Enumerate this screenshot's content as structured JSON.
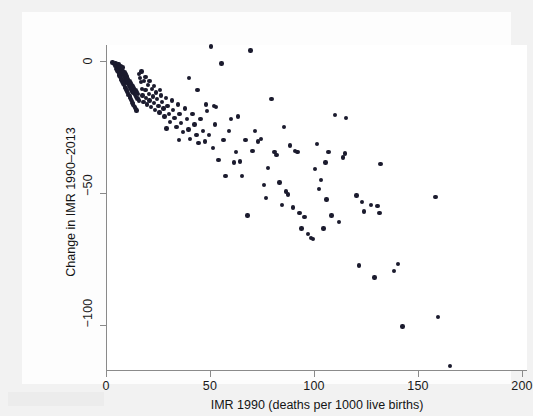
{
  "figure": {
    "background_color": "#f2f2f2",
    "plot_background_color": "#ffffff",
    "marker_color": "#1b1b2e",
    "grid_color": "#ececec",
    "axis_color": "#8a8a8a"
  },
  "chart_data": {
    "type": "scatter",
    "title": "",
    "xlabel": "IMR 1990 (deaths per 1000 live births)",
    "ylabel": "Change in IMR 1990–2013",
    "xlim": [
      0,
      200
    ],
    "ylim": [
      -120,
      8
    ],
    "xticks": [
      0,
      50,
      100,
      150,
      200
    ],
    "xtick_labels": [
      "0",
      "50",
      "100",
      "150",
      "200"
    ],
    "yticks": [
      0,
      -50,
      -100
    ],
    "ytick_labels": [
      "0",
      "−50",
      "−100"
    ],
    "grid": "horizontal",
    "legend": "none",
    "n_points": 193,
    "points": [
      [
        4.5,
        -1.0
      ],
      [
        5.2,
        -1.5
      ],
      [
        5.5,
        -2.3
      ],
      [
        6.0,
        -1.2
      ],
      [
        6.3,
        -2.8
      ],
      [
        6.6,
        -3.4
      ],
      [
        6.9,
        -2.0
      ],
      [
        7.1,
        -4.0
      ],
      [
        7.4,
        -3.1
      ],
      [
        7.6,
        -4.6
      ],
      [
        7.9,
        -2.5
      ],
      [
        8.1,
        -5.2
      ],
      [
        8.3,
        -3.8
      ],
      [
        8.6,
        -6.0
      ],
      [
        8.8,
        -4.4
      ],
      [
        9.0,
        -6.8
      ],
      [
        9.3,
        -5.0
      ],
      [
        9.5,
        -7.4
      ],
      [
        9.8,
        -5.8
      ],
      [
        10.0,
        -8.1
      ],
      [
        10.2,
        -6.4
      ],
      [
        10.5,
        -8.8
      ],
      [
        10.7,
        -7.0
      ],
      [
        11.0,
        -9.4
      ],
      [
        11.2,
        -7.7
      ],
      [
        11.5,
        -10.1
      ],
      [
        11.8,
        -8.4
      ],
      [
        12.0,
        -10.8
      ],
      [
        12.3,
        -9.0
      ],
      [
        12.6,
        -11.5
      ],
      [
        12.9,
        -9.7
      ],
      [
        13.2,
        -12.2
      ],
      [
        13.5,
        -10.4
      ],
      [
        13.8,
        -12.9
      ],
      [
        14.1,
        -11.1
      ],
      [
        14.5,
        -13.6
      ],
      [
        14.8,
        -11.8
      ],
      [
        15.2,
        -14.2
      ],
      [
        15.5,
        -12.5
      ],
      [
        15.9,
        -14.9
      ],
      [
        5.0,
        -3.0
      ],
      [
        5.8,
        -4.2
      ],
      [
        6.5,
        -5.5
      ],
      [
        7.2,
        -6.6
      ],
      [
        8.0,
        -7.8
      ],
      [
        8.7,
        -9.1
      ],
      [
        9.4,
        -10.3
      ],
      [
        10.1,
        -11.6
      ],
      [
        10.9,
        -12.8
      ],
      [
        11.6,
        -14.0
      ],
      [
        12.4,
        -15.2
      ],
      [
        13.1,
        -16.4
      ],
      [
        13.9,
        -17.6
      ],
      [
        14.6,
        -18.8
      ],
      [
        4.8,
        -2.0
      ],
      [
        5.4,
        -3.6
      ],
      [
        6.1,
        -4.8
      ],
      [
        6.8,
        -6.0
      ],
      [
        7.5,
        -7.2
      ],
      [
        8.4,
        -8.5
      ],
      [
        9.1,
        -9.8
      ],
      [
        9.9,
        -11.0
      ],
      [
        10.6,
        -12.2
      ],
      [
        11.4,
        -13.4
      ],
      [
        12.1,
        -14.6
      ],
      [
        12.8,
        -15.8
      ],
      [
        13.6,
        -17.0
      ],
      [
        14.3,
        -18.2
      ],
      [
        16.3,
        -6.5
      ],
      [
        16.8,
        -8.0
      ],
      [
        17.2,
        -10.5
      ],
      [
        17.6,
        -13.0
      ],
      [
        18.0,
        -15.5
      ],
      [
        18.4,
        -7.5
      ],
      [
        18.9,
        -11.0
      ],
      [
        19.3,
        -14.0
      ],
      [
        19.7,
        -16.5
      ],
      [
        20.2,
        -9.0
      ],
      [
        20.6,
        -12.5
      ],
      [
        21.0,
        -15.0
      ],
      [
        21.5,
        -17.5
      ],
      [
        22.0,
        -10.5
      ],
      [
        22.5,
        -13.5
      ],
      [
        23.0,
        -16.0
      ],
      [
        23.5,
        -18.5
      ],
      [
        24.0,
        -12.0
      ],
      [
        24.6,
        -14.5
      ],
      [
        25.2,
        -17.0
      ],
      [
        25.8,
        -19.5
      ],
      [
        26.4,
        -13.0
      ],
      [
        27.0,
        -15.5
      ],
      [
        27.6,
        -18.0
      ],
      [
        28.2,
        -21.0
      ],
      [
        28.9,
        -14.0
      ],
      [
        29.5,
        -17.0
      ],
      [
        30.2,
        -20.0
      ],
      [
        30.9,
        -23.0
      ],
      [
        31.6,
        -15.0
      ],
      [
        32.3,
        -18.5
      ],
      [
        33.0,
        -21.5
      ],
      [
        33.8,
        -25.0
      ],
      [
        34.5,
        -16.5
      ],
      [
        35.3,
        -20.0
      ],
      [
        36.1,
        -23.5
      ],
      [
        37.0,
        -27.0
      ],
      [
        38.0,
        -18.0
      ],
      [
        38.8,
        -22.0
      ],
      [
        39.6,
        -26.0
      ],
      [
        40.5,
        -29.5
      ],
      [
        41.5,
        -20.0
      ],
      [
        42.5,
        -24.0
      ],
      [
        43.5,
        -28.0
      ],
      [
        44.5,
        -31.0
      ],
      [
        45.5,
        -22.0
      ],
      [
        46.5,
        -26.5
      ],
      [
        47.5,
        -30.5
      ],
      [
        48.5,
        -19.0
      ],
      [
        49.5,
        -28.0
      ],
      [
        50.5,
        5.5
      ],
      [
        51.5,
        -33.0
      ],
      [
        52.5,
        -24.0
      ],
      [
        54.0,
        -37.5
      ],
      [
        55.5,
        -1.0
      ],
      [
        56.5,
        -30.0
      ],
      [
        57.5,
        -43.5
      ],
      [
        59.0,
        -26.5
      ],
      [
        60.0,
        -22.0
      ],
      [
        61.5,
        -38.5
      ],
      [
        62.5,
        -34.5
      ],
      [
        63.5,
        -21.0
      ],
      [
        64.5,
        -38.0
      ],
      [
        65.5,
        -43.5
      ],
      [
        67.0,
        -30.0
      ],
      [
        68.0,
        -58.5
      ],
      [
        69.5,
        4.0
      ],
      [
        70.5,
        -34.0
      ],
      [
        71.5,
        -26.5
      ],
      [
        73.0,
        -30.5
      ],
      [
        74.5,
        -29.5
      ],
      [
        76.0,
        -47.0
      ],
      [
        77.0,
        -52.0
      ],
      [
        78.0,
        -40.5
      ],
      [
        79.5,
        -14.5
      ],
      [
        81.0,
        -34.5
      ],
      [
        82.0,
        -35.5
      ],
      [
        83.5,
        -46.0
      ],
      [
        84.5,
        -54.5
      ],
      [
        85.5,
        -25.0
      ],
      [
        86.5,
        -49.5
      ],
      [
        87.5,
        -50.5
      ],
      [
        88.5,
        -32.0
      ],
      [
        90.0,
        -55.5
      ],
      [
        91.0,
        -34.0
      ],
      [
        92.0,
        -34.5
      ],
      [
        93.0,
        -57.5
      ],
      [
        94.0,
        -63.5
      ],
      [
        95.5,
        -59.0
      ],
      [
        97.0,
        -65.5
      ],
      [
        98.5,
        -67.0
      ],
      [
        99.5,
        -67.5
      ],
      [
        100.5,
        -41.0
      ],
      [
        101.5,
        -31.5
      ],
      [
        102.5,
        -48.5
      ],
      [
        103.5,
        -45.0
      ],
      [
        104.5,
        -63.5
      ],
      [
        105.5,
        -38.5
      ],
      [
        106.0,
        -52.5
      ],
      [
        107.0,
        -34.5
      ],
      [
        108.5,
        -58.5
      ],
      [
        110.0,
        -20.5
      ],
      [
        112.0,
        -61.0
      ],
      [
        114.0,
        -36.5
      ],
      [
        115.0,
        -35.0
      ],
      [
        115.5,
        -21.5
      ],
      [
        120.5,
        -51.0
      ],
      [
        121.5,
        -77.5
      ],
      [
        123.0,
        -53.5
      ],
      [
        124.0,
        -57.0
      ],
      [
        127.5,
        -54.5
      ],
      [
        129.0,
        -82.0
      ],
      [
        130.5,
        -55.0
      ],
      [
        131.5,
        -57.5
      ],
      [
        132.0,
        -39.0
      ],
      [
        138.5,
        -79.5
      ],
      [
        140.5,
        -77.0
      ],
      [
        142.5,
        -100.5
      ],
      [
        158.5,
        -51.5
      ],
      [
        159.5,
        -97.0
      ],
      [
        165.5,
        -115.5
      ],
      [
        3.2,
        -0.6
      ],
      [
        3.8,
        -1.1
      ],
      [
        4.2,
        -1.8
      ],
      [
        16.0,
        -5.0
      ],
      [
        17.0,
        -4.0
      ],
      [
        19.0,
        -6.0
      ],
      [
        21.0,
        -7.5
      ],
      [
        23.0,
        -9.5
      ],
      [
        26.0,
        -11.0
      ],
      [
        29.0,
        -25.5
      ],
      [
        35.0,
        -30.0
      ],
      [
        40.0,
        -6.5
      ],
      [
        44.0,
        -11.0
      ],
      [
        48.0,
        -16.5
      ],
      [
        52.0,
        -17.0
      ],
      [
        53.0,
        -17.5
      ]
    ]
  }
}
